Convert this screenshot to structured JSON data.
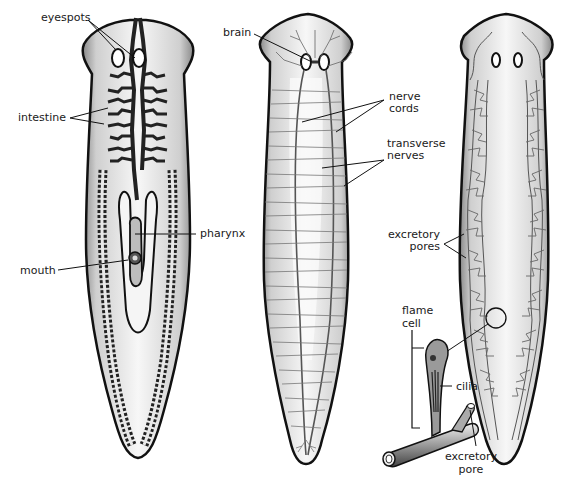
{
  "figure": {
    "panels": [
      {
        "id": "digestive",
        "description": "Digestive system",
        "labels": {
          "eyespots": "eyespots",
          "intestine": "intestine",
          "pharynx": "pharynx",
          "mouth": "mouth"
        }
      },
      {
        "id": "nervous",
        "description": "Nervous system",
        "labels": {
          "brain": "brain",
          "nerve_cords_1": "nerve",
          "nerve_cords_2": "cords",
          "transverse_nerves_1": "transverse",
          "transverse_nerves_2": "nerves"
        }
      },
      {
        "id": "excretory",
        "description": "Excretory system",
        "labels": {
          "excretory_pores_1": "excretory",
          "excretory_pores_2": "pores",
          "flame_cell_1": "flame",
          "flame_cell_2": "cell",
          "cilia": "cilia",
          "excretory_pore_1": "excretory",
          "excretory_pore_2": "pore"
        }
      }
    ],
    "colors": {
      "background": "#ffffff",
      "outline": "#1a1a1a",
      "body_fill": "#d9d9d9",
      "body_light": "#f2f2f2",
      "vessel": "#555555",
      "label": "#1a1a1a"
    }
  }
}
